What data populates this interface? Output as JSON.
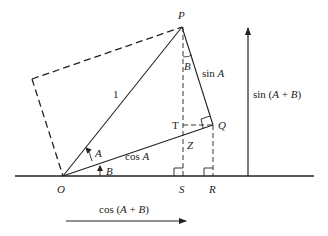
{
  "points": {
    "P": "P",
    "Q": "Q",
    "O": "O",
    "S": "S",
    "R": "R",
    "T": "T",
    "Z": "Z"
  },
  "labels": {
    "hypotenuse": "1",
    "sinA": "sin A",
    "cosA": "cos A",
    "angleA": "A",
    "angleB": "B",
    "angleB_at_P": "B",
    "sinAB": "sin (A + B)",
    "cosAB": "cos (A + B)"
  },
  "colors": {
    "line": "#222222",
    "background": "#ffffff"
  }
}
